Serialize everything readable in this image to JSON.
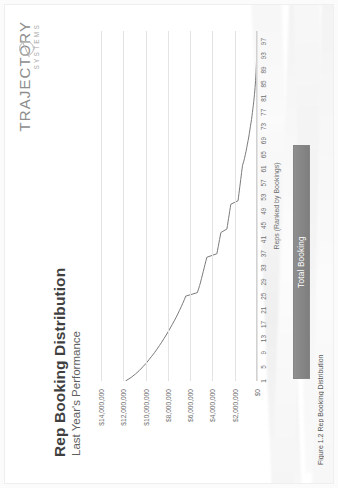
{
  "brand": {
    "name": "TRAJECTORY",
    "tagline": "SYSTEMS",
    "mark": "circle-slash-icon"
  },
  "slide": {
    "title": "Rep Booking Distribution",
    "subtitle": "Last Year's Performance",
    "caption": "Figure 1.2 Rep Booking Distribution"
  },
  "legend": {
    "series_label": "Total Booking",
    "position": "bottom",
    "band_color": "#848484",
    "text_color": "#ffffff"
  },
  "colors": {
    "line": "#7a7a7a",
    "gridline": "#e3e3e3",
    "axis_text": "#6e6e6e",
    "title_text": "#3f3f3f",
    "background": "#ffffff"
  },
  "chart_data": {
    "type": "line",
    "title": "Rep Booking Distribution",
    "subtitle": "Last Year's Performance",
    "xlabel": "Reps (Ranked by Bookings)",
    "ylabel": "",
    "grid": true,
    "legend_position": "bottom",
    "series_name": "Total Booking",
    "ylim": [
      0,
      14000000
    ],
    "xlim": [
      1,
      100
    ],
    "ytick_labels": [
      "$0",
      "$2,000,000",
      "$4,000,000",
      "$6,000,000",
      "$8,000,000",
      "$10,000,000",
      "$12,000,000",
      "$14,000,000"
    ],
    "ytick_values": [
      0,
      2000000,
      4000000,
      6000000,
      8000000,
      10000000,
      12000000,
      14000000
    ],
    "xtick_labels": [
      "1",
      "5",
      "9",
      "13",
      "17",
      "21",
      "25",
      "29",
      "33",
      "37",
      "41",
      "45",
      "49",
      "53",
      "57",
      "61",
      "65",
      "69",
      "73",
      "77",
      "81",
      "85",
      "89",
      "93",
      "97"
    ],
    "xtick_values": [
      1,
      5,
      9,
      13,
      17,
      21,
      25,
      29,
      33,
      37,
      41,
      45,
      49,
      53,
      57,
      61,
      65,
      69,
      73,
      77,
      81,
      85,
      89,
      93,
      97
    ],
    "x": [
      1,
      2,
      3,
      4,
      5,
      6,
      7,
      8,
      9,
      10,
      11,
      12,
      13,
      14,
      15,
      16,
      17,
      18,
      19,
      20,
      21,
      22,
      23,
      24,
      25,
      26,
      27,
      28,
      29,
      30,
      31,
      32,
      33,
      34,
      35,
      36,
      37,
      38,
      39,
      40,
      41,
      42,
      43,
      44,
      45,
      46,
      47,
      48,
      49,
      50,
      51,
      52,
      53,
      54,
      55,
      56,
      57,
      58,
      59,
      60,
      61,
      62,
      63,
      64,
      65,
      66,
      67,
      68,
      69,
      70,
      71,
      72,
      73,
      74,
      75,
      76,
      77,
      78,
      79,
      80,
      81,
      82,
      83,
      84,
      85,
      86,
      87,
      88,
      89,
      90,
      91,
      92,
      93,
      94,
      95,
      96,
      97,
      98,
      99,
      100
    ],
    "values": [
      11800000,
      11300000,
      10900000,
      10550000,
      10250000,
      9950000,
      9700000,
      9450000,
      9200000,
      8980000,
      8760000,
      8550000,
      8350000,
      8150000,
      7960000,
      7780000,
      7600000,
      7430000,
      7260000,
      7100000,
      6950000,
      6800000,
      6660000,
      6520000,
      6400000,
      5350000,
      5250000,
      5150000,
      5060000,
      4980000,
      4900000,
      4820000,
      4740000,
      4660000,
      4580000,
      4500000,
      3600000,
      3540000,
      3480000,
      3420000,
      3360000,
      3300000,
      3240000,
      2700000,
      2650000,
      2600000,
      2550000,
      2500000,
      2450000,
      2400000,
      2350000,
      1700000,
      1660000,
      1620000,
      1580000,
      1540000,
      1500000,
      1460000,
      1420000,
      1380000,
      1340000,
      1300000,
      1200000,
      1120000,
      1050000,
      980000,
      920000,
      860000,
      800000,
      740000,
      690000,
      640000,
      590000,
      540000,
      490000,
      450000,
      410000,
      370000,
      330000,
      295000,
      260000,
      230000,
      200000,
      175000,
      150000,
      128000,
      108000,
      90000,
      74000,
      60000,
      48000,
      38000,
      29000,
      21000,
      15000,
      10000,
      6000,
      3000,
      1200,
      0
    ]
  }
}
